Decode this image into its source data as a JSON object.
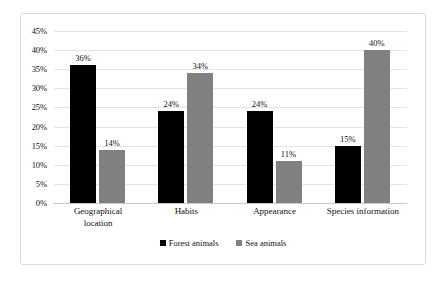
{
  "chart_data": {
    "type": "bar",
    "title": "",
    "subtitle": "",
    "xlabel": "",
    "ylabel": "",
    "grid": true,
    "legend_position": "bottom",
    "ylim": [
      0,
      45
    ],
    "ytick_labels": [
      "45%",
      "40%",
      "35%",
      "30%",
      "25%",
      "20%",
      "15%",
      "10%",
      "5%",
      "0%"
    ],
    "ytick_values": [
      45,
      40,
      35,
      30,
      25,
      20,
      15,
      10,
      5,
      0
    ],
    "categories": [
      "Geographical location",
      "Habits",
      "Appearance",
      "Species information"
    ],
    "category_lines": [
      [
        "Geographical",
        "location"
      ],
      [
        "Habits"
      ],
      [
        "Appearance"
      ],
      [
        "Species information"
      ]
    ],
    "series": [
      {
        "name": "Forest animals",
        "color": "#000000",
        "values": [
          36,
          24,
          24,
          15
        ],
        "labels": [
          "36%",
          "24%",
          "24%",
          "15%"
        ]
      },
      {
        "name": "Sea animals",
        "color": "#808080",
        "values": [
          14,
          34,
          11,
          40
        ],
        "labels": [
          "14%",
          "34%",
          "11%",
          "40%"
        ]
      }
    ]
  },
  "colors": {
    "forest_animals": "#000000",
    "sea_animals": "#808080",
    "gridline": "#e4e4e4",
    "frame_border": "#d9d9d9",
    "background": "#ffffff",
    "text": "#111111"
  }
}
